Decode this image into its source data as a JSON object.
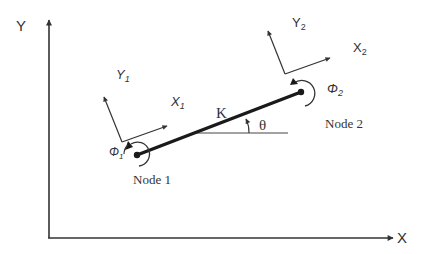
{
  "diagram": {
    "type": "beam-element-coordinate-systems",
    "global_axes": {
      "x_label": "X",
      "y_label": "Y"
    },
    "element": {
      "stiffness_label": "K",
      "angle_label": "θ"
    },
    "nodes": [
      {
        "label": "Node 1",
        "local_x_label": "X",
        "local_x_sub": "1",
        "local_y_label": "Y",
        "local_y_sub": "1",
        "rotation_label": "Φ",
        "rotation_sub": "1"
      },
      {
        "label": "Node 2",
        "local_x_label": "X",
        "local_x_sub": "2",
        "local_y_label": "Y",
        "local_y_sub": "2",
        "rotation_label": "Φ",
        "rotation_sub": "2"
      }
    ],
    "colors": {
      "line": "#333333",
      "element": "#1a1a1a",
      "background": "#ffffff"
    }
  }
}
